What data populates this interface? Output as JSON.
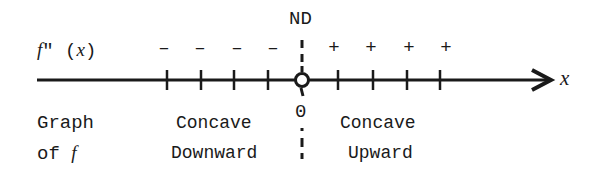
{
  "diagram": {
    "row_label": "f\" (x)",
    "row_label_parts": {
      "f": "f",
      "prime": "\"",
      "open": "(",
      "x": "x",
      "close": ")"
    },
    "critical_label": "ND",
    "critical_value": "0",
    "axis_label": "x",
    "negative_signs": [
      "–",
      "–",
      "–",
      "–"
    ],
    "positive_signs": [
      "+",
      "+",
      "+",
      "+"
    ],
    "graph_label": {
      "line1": "Graph",
      "line2_text": "of",
      "line2_f": "f"
    },
    "left_region": {
      "line1": "Concave",
      "line2": "Downward"
    },
    "right_region": {
      "line1": "Concave",
      "line2": "Upward"
    },
    "colors": {
      "ink": "#1a1a1a",
      "background": "#ffffff"
    }
  }
}
